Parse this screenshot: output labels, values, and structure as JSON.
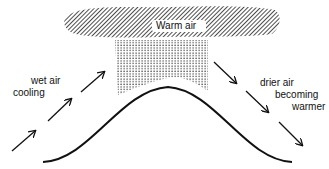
{
  "diagram": {
    "cloud_label": "Warm air",
    "left_label_line1": "wet air",
    "left_label_line2": "cooling",
    "right_label_line1": "drier air",
    "right_label_line2": "becoming",
    "right_label_line3": "warmer"
  },
  "colors": {
    "ink": "#111111",
    "background": "#ffffff"
  }
}
